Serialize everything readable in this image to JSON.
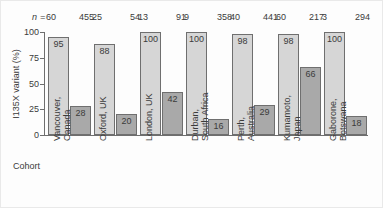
{
  "figure": {
    "n_prefix": "n =",
    "cohort_axis_title": "Cohort",
    "y_axis_label": "I135X variant (%)"
  },
  "chart_data": {
    "type": "bar",
    "title": "",
    "xlabel": "Cohort",
    "ylabel": "I135X variant (%)",
    "ylim": [
      0,
      100
    ],
    "yticks": [
      0,
      25,
      50,
      75,
      100
    ],
    "grid": false,
    "legend": null,
    "categories": [
      "Vancouver, Canada",
      "Oxford, UK",
      "London, UK",
      "Durban, South Africa",
      "Perth, Australia",
      "Kumamoto, Japan",
      "Gaborone, Botswana"
    ],
    "series": [
      {
        "name": "series-1-light",
        "values": [
          95,
          88,
          100,
          100,
          98,
          98,
          100
        ]
      },
      {
        "name": "series-2-dark",
        "values": [
          28,
          20,
          42,
          16,
          29,
          66,
          18
        ]
      }
    ],
    "n_values": [
      {
        "series1": "60",
        "series2": "455"
      },
      {
        "series1": "25",
        "series2": "54"
      },
      {
        "series1": "13",
        "series2": "91"
      },
      {
        "series1": "9",
        "series2": "358"
      },
      {
        "series1": "40",
        "series2": "441"
      },
      {
        "series1": "60",
        "series2": "217"
      },
      {
        "series1": "3",
        "series2": "294"
      }
    ],
    "colors": {
      "series1_fill": "#d6d6d6",
      "series2_fill": "#a9a9a9",
      "bar_stroke": "#6f6f6f",
      "axis": "#6e6e6e",
      "text": "#3b3b3b"
    }
  },
  "cohort_labels": [
    {
      "line1": "Vancouver,",
      "line2": "Canada"
    },
    {
      "line1": "Oxford, UK",
      "line2": ""
    },
    {
      "line1": "London, UK",
      "line2": ""
    },
    {
      "line1": "Durban,",
      "line2": "South Africa"
    },
    {
      "line1": "Perth,",
      "line2": "Australia"
    },
    {
      "line1": "Kumamoto,",
      "line2": "Japan"
    },
    {
      "line1": "Gaborone,",
      "line2": "Botswana"
    }
  ],
  "bar_labels": {
    "light": [
      "95",
      "88",
      "100",
      "100",
      "98",
      "98",
      "100"
    ],
    "dark": [
      "28",
      "20",
      "42",
      "16",
      "29",
      "66",
      "18"
    ]
  },
  "ytick_labels": [
    "100",
    "75",
    "50",
    "25",
    "0"
  ]
}
